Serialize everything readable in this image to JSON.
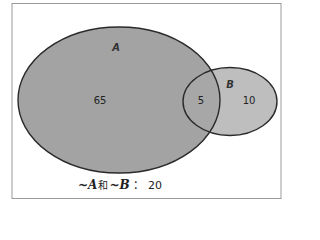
{
  "diagram": {
    "type": "venn",
    "sets": [
      {
        "name": "A",
        "label": "A",
        "only_count": "65",
        "fill": "#a3a3a3"
      },
      {
        "name": "B",
        "label": "B",
        "only_count": "10",
        "fill": "#bebebe"
      }
    ],
    "intersection": {
      "label": "A∩B",
      "count": "5",
      "fill": "#a6a6a6"
    },
    "outside": {
      "neg_a": "~A",
      "conj": "和",
      "neg_b": "~B",
      "separator": "：",
      "count": "20"
    },
    "colors": {
      "frame": "#9a9a9a",
      "outline": "#2a2a2a",
      "background": "#ffffff"
    }
  }
}
